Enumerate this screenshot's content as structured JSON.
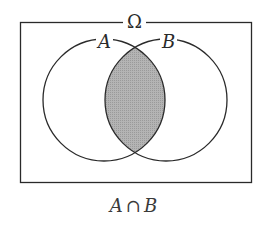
{
  "diagram": {
    "type": "venn",
    "universe_label": "Ω",
    "sets": [
      {
        "name": "A",
        "label": "A",
        "cx": 104,
        "cy": 100,
        "r": 61
      },
      {
        "name": "B",
        "label": "B",
        "cx": 166,
        "cy": 100,
        "r": 61
      }
    ],
    "shaded_region": "A ∩ B",
    "shade_color": "#a9a9a9",
    "stroke_color": "#2a2a2a",
    "caption": {
      "left": "A",
      "operator": "∩",
      "right": "B"
    }
  }
}
